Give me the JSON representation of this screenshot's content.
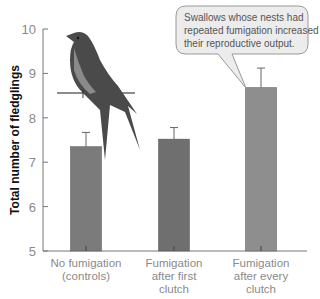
{
  "chart_data": {
    "type": "bar",
    "title": "",
    "xlabel": "",
    "ylabel": "Total number of fledglings",
    "ylim": [
      5,
      10
    ],
    "yticks": [
      5,
      6,
      7,
      8,
      9,
      10
    ],
    "grid": false,
    "categories": [
      [
        "No fumigation",
        "(controls)"
      ],
      [
        "Fumigation",
        "after first",
        "clutch"
      ],
      [
        "Fumigation",
        "after every",
        "clutch"
      ]
    ],
    "values": [
      7.35,
      7.52,
      8.68
    ],
    "error_upper": [
      7.67,
      7.78,
      9.12
    ],
    "bar_colors": [
      "#7b7b7b",
      "#6f6f6f",
      "#8e8e8e"
    ],
    "annotation": {
      "lines": [
        "Swallows whose nests had",
        "repeated fumigation increased",
        "their reproductive output."
      ],
      "points_to": 2
    },
    "illustration": "swallow perched on a wire"
  }
}
